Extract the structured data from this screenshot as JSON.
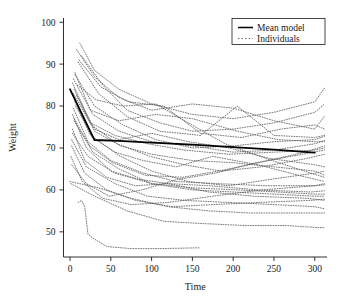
{
  "chart_data": {
    "type": "line",
    "title": "",
    "xlabel": "Time",
    "ylabel": "Weight",
    "xlim": [
      -8,
      315
    ],
    "ylim": [
      44,
      101
    ],
    "xticks": [
      0,
      50,
      100,
      150,
      200,
      250,
      300
    ],
    "yticks": [
      50,
      60,
      70,
      80,
      90,
      100
    ],
    "grid": false,
    "legend_position": "top-right",
    "legend": [
      {
        "label": "Mean model",
        "style": "solid",
        "color": "#000000"
      },
      {
        "label": "Individuals",
        "style": "dotted",
        "color": "#555555"
      }
    ],
    "series": [
      {
        "name": "Mean model",
        "style": "solid",
        "color": "#000000",
        "width": 1.8,
        "x": [
          0,
          30,
          60,
          100,
          150,
          200,
          250,
          300
        ],
        "y": [
          84.0,
          71.9,
          71.7,
          71.3,
          70.8,
          70.2,
          69.6,
          68.9
        ]
      },
      {
        "name": "Individual 1",
        "style": "dotted",
        "color": "#606060",
        "x": [
          12,
          30,
          60,
          100,
          150,
          200,
          250,
          300,
          312
        ],
        "y": [
          95.0,
          88.5,
          84.0,
          80.5,
          78.0,
          77.0,
          78.5,
          81.0,
          84.3
        ]
      },
      {
        "name": "Individual 2",
        "style": "dotted",
        "color": "#606060",
        "x": [
          8,
          30,
          60,
          100,
          150,
          200,
          250,
          300,
          312
        ],
        "y": [
          93.5,
          87.0,
          82.0,
          79.0,
          80.5,
          79.5,
          76.5,
          74.5,
          77.6
        ]
      },
      {
        "name": "Individual 3",
        "style": "dotted",
        "color": "#606060",
        "x": [
          14,
          40,
          70,
          110,
          150,
          200,
          250,
          300,
          312
        ],
        "y": [
          92.0,
          85.0,
          79.0,
          76.0,
          74.0,
          74.5,
          76.0,
          78.5,
          80.5
        ]
      },
      {
        "name": "Individual 4",
        "style": "dotted",
        "color": "#606060",
        "x": [
          10,
          35,
          70,
          110,
          160,
          205,
          250,
          300,
          312
        ],
        "y": [
          90.5,
          83.0,
          77.5,
          74.0,
          73.0,
          80.0,
          73.0,
          72.5,
          73.0
        ]
      },
      {
        "name": "Individual 5",
        "style": "dotted",
        "color": "#606060",
        "x": [
          6,
          30,
          65,
          105,
          150,
          200,
          250,
          300,
          312
        ],
        "y": [
          87.5,
          80.0,
          75.5,
          72.0,
          70.0,
          70.5,
          71.5,
          72.0,
          72.8
        ]
      },
      {
        "name": "Individual 6",
        "style": "dotted",
        "color": "#606060",
        "x": [
          4,
          28,
          60,
          100,
          150,
          200,
          250,
          300,
          312
        ],
        "y": [
          86.5,
          78.0,
          74.0,
          71.5,
          70.5,
          69.0,
          69.5,
          71.0,
          71.8
        ]
      },
      {
        "name": "Individual 7",
        "style": "dotted",
        "color": "#606060",
        "x": [
          3,
          25,
          55,
          95,
          140,
          195,
          250,
          300,
          312
        ],
        "y": [
          85.5,
          76.0,
          73.0,
          71.0,
          69.5,
          68.5,
          69.0,
          69.5,
          70.0
        ]
      },
      {
        "name": "Individual 8",
        "style": "dotted",
        "color": "#606060",
        "x": [
          5,
          30,
          60,
          100,
          145,
          195,
          245,
          300,
          312
        ],
        "y": [
          84.0,
          74.5,
          72.0,
          73.5,
          71.5,
          70.0,
          67.5,
          66.0,
          65.5
        ]
      },
      {
        "name": "Individual 9",
        "style": "dotted",
        "color": "#606060",
        "x": [
          8,
          30,
          62,
          100,
          150,
          200,
          250,
          300,
          312
        ],
        "y": [
          82.5,
          74.0,
          70.5,
          68.5,
          67.0,
          66.5,
          65.5,
          64.5,
          63.5
        ]
      },
      {
        "name": "Individual 10",
        "style": "dotted",
        "color": "#606060",
        "x": [
          6,
          25,
          55,
          90,
          130,
          175,
          230,
          290,
          312
        ],
        "y": [
          81.0,
          73.0,
          69.0,
          67.0,
          65.5,
          68.0,
          66.0,
          63.0,
          62.0
        ]
      },
      {
        "name": "Individual 11",
        "style": "dotted",
        "color": "#606060",
        "x": [
          4,
          22,
          50,
          90,
          130,
          180,
          240,
          300,
          312
        ],
        "y": [
          79.5,
          71.5,
          67.0,
          64.0,
          62.0,
          61.5,
          61.0,
          61.0,
          61.2
        ]
      },
      {
        "name": "Individual 12",
        "style": "dotted",
        "color": "#606060",
        "x": [
          3,
          20,
          50,
          85,
          120,
          170,
          230,
          295,
          312
        ],
        "y": [
          78.0,
          70.0,
          64.5,
          62.5,
          61.5,
          61.0,
          60.0,
          59.5,
          59.8
        ]
      },
      {
        "name": "Individual 13",
        "style": "dotted",
        "color": "#606060",
        "x": [
          5,
          28,
          60,
          100,
          150,
          200,
          250,
          300,
          312
        ],
        "y": [
          76.5,
          69.0,
          65.0,
          61.5,
          60.0,
          59.5,
          59.0,
          58.5,
          58.5
        ]
      },
      {
        "name": "Individual 14",
        "style": "dotted",
        "color": "#606060",
        "x": [
          3,
          18,
          45,
          80,
          120,
          170,
          225,
          290,
          312
        ],
        "y": [
          74.5,
          67.0,
          63.0,
          61.0,
          61.5,
          59.5,
          58.5,
          58.0,
          57.5
        ]
      },
      {
        "name": "Individual 15",
        "style": "dotted",
        "color": "#606060",
        "x": [
          2,
          20,
          55,
          95,
          140,
          195,
          250,
          300,
          312
        ],
        "y": [
          72.0,
          65.5,
          61.5,
          58.5,
          57.5,
          57.0,
          56.5,
          56.0,
          55.5
        ]
      },
      {
        "name": "Individual 16",
        "style": "dotted",
        "color": "#606060",
        "x": [
          2,
          18,
          45,
          80,
          125,
          175,
          230,
          295,
          312
        ],
        "y": [
          70.5,
          64.0,
          60.0,
          57.5,
          56.0,
          56.5,
          57.0,
          57.5,
          57.8
        ]
      },
      {
        "name": "Individual 17",
        "style": "dotted",
        "color": "#606060",
        "x": [
          1,
          15,
          40,
          75,
          120,
          175,
          235,
          300,
          312
        ],
        "y": [
          68.0,
          62.0,
          58.0,
          56.5,
          57.0,
          58.5,
          60.0,
          61.0,
          61.5
        ]
      },
      {
        "name": "Individual 18",
        "style": "dotted",
        "color": "#606060",
        "x": [
          0,
          35,
          75,
          120,
          170,
          220,
          270,
          305,
          312
        ],
        "y": [
          62.0,
          60.5,
          58.0,
          56.0,
          55.0,
          54.5,
          54.5,
          54.5,
          54.5
        ]
      },
      {
        "name": "Individual 19",
        "style": "dotted",
        "color": "#606060",
        "x": [
          1,
          30,
          70,
          115,
          160,
          215,
          265,
          305,
          312
        ],
        "y": [
          61.5,
          58.5,
          55.0,
          52.5,
          52.0,
          51.5,
          51.5,
          51.0,
          51.0
        ]
      },
      {
        "name": "Individual 20",
        "style": "dotted",
        "color": "#606060",
        "x": [
          10,
          14,
          18,
          22,
          28,
          45,
          75,
          110,
          160
        ],
        "y": [
          57.0,
          57.5,
          56.0,
          49.5,
          48.5,
          46.5,
          46.0,
          46.0,
          46.2
        ]
      },
      {
        "name": "Individual 21",
        "style": "dotted",
        "color": "#606060",
        "x": [
          6,
          25,
          60,
          105,
          150,
          205,
          255,
          300,
          312
        ],
        "y": [
          88.0,
          79.0,
          76.5,
          78.0,
          77.0,
          74.0,
          72.0,
          71.5,
          71.5
        ]
      },
      {
        "name": "Individual 22",
        "style": "dotted",
        "color": "#606060",
        "x": [
          9,
          32,
          65,
          105,
          145,
          190,
          240,
          295,
          312
        ],
        "y": [
          85.0,
          81.5,
          80.0,
          80.5,
          76.0,
          71.0,
          67.5,
          64.0,
          63.0
        ]
      },
      {
        "name": "Individual 23",
        "style": "dotted",
        "color": "#606060",
        "x": [
          4,
          26,
          58,
          98,
          140,
          185,
          235,
          290,
          312
        ],
        "y": [
          83.0,
          75.5,
          71.0,
          68.0,
          66.0,
          64.5,
          65.5,
          67.5,
          68.5
        ]
      },
      {
        "name": "Individual 24",
        "style": "dotted",
        "color": "#606060",
        "x": [
          7,
          28,
          62,
          100,
          145,
          195,
          245,
          300,
          312
        ],
        "y": [
          80.0,
          72.5,
          68.0,
          64.5,
          62.0,
          61.0,
          62.5,
          64.0,
          64.5
        ]
      },
      {
        "name": "Individual 25",
        "style": "dotted",
        "color": "#606060",
        "x": [
          5,
          24,
          52,
          92,
          138,
          182,
          232,
          288,
          312
        ],
        "y": [
          77.0,
          70.5,
          66.5,
          63.5,
          63.0,
          64.5,
          66.5,
          69.0,
          70.5
        ]
      },
      {
        "name": "Individual 26",
        "style": "dotted",
        "color": "#606060",
        "x": [
          3,
          22,
          55,
          100,
          150,
          205,
          255,
          300,
          312
        ],
        "y": [
          73.5,
          68.0,
          64.0,
          61.5,
          60.5,
          60.0,
          59.5,
          59.0,
          59.0
        ]
      },
      {
        "name": "Individual 27",
        "style": "dotted",
        "color": "#606060",
        "x": [
          11,
          38,
          72,
          115,
          160,
          210,
          258,
          300,
          312
        ],
        "y": [
          91.0,
          84.5,
          81.0,
          80.0,
          73.5,
          72.5,
          74.5,
          75.5,
          74.5
        ]
      },
      {
        "name": "Individual 28",
        "style": "dotted",
        "color": "#606060",
        "x": [
          2,
          20,
          48,
          88,
          132,
          178,
          228,
          285,
          312
        ],
        "y": [
          66.0,
          61.5,
          58.5,
          60.0,
          62.5,
          64.0,
          66.5,
          68.5,
          69.5
        ]
      }
    ]
  },
  "axes": {
    "x_tick_labels": [
      "0",
      "50",
      "100",
      "150",
      "200",
      "250",
      "300"
    ],
    "y_tick_labels": [
      "50",
      "60",
      "70",
      "80",
      "90",
      "100"
    ],
    "x_axis_title": "Time",
    "y_axis_title": "Weight"
  },
  "legend": {
    "entries": [
      {
        "label": "Mean model"
      },
      {
        "label": "Individuals"
      }
    ]
  },
  "colors": {
    "axis": "#1a1a1a",
    "mean_line": "#000000",
    "individual_line": "#606060",
    "background": "#ffffff"
  }
}
